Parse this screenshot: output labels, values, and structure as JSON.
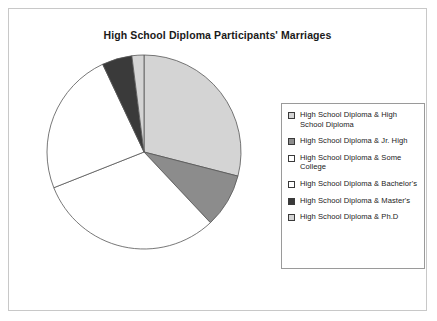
{
  "chart_title": "High School Diploma Participants' Marriages",
  "legend": {
    "items": [
      {
        "label": "High School Diploma & High School Diploma",
        "color": "#d4d4d4",
        "swatch_icon": "legend-swatch-icon"
      },
      {
        "label": "High School Diploma & Jr. High",
        "color": "#8c8c8c",
        "swatch_icon": "legend-swatch-icon"
      },
      {
        "label": "High School Diploma & Some College",
        "color": "#ffffff",
        "swatch_icon": "legend-swatch-icon"
      },
      {
        "label": "High School Diploma & Bachelor's",
        "color": "#ffffff",
        "swatch_icon": "legend-swatch-icon"
      },
      {
        "label": "High School Diploma & Master's",
        "color": "#3a3a3a",
        "swatch_icon": "legend-swatch-icon"
      },
      {
        "label": "High School Diploma & Ph.D",
        "color": "#d4d4d4",
        "swatch_icon": "legend-swatch-icon"
      }
    ]
  },
  "chart_data": {
    "type": "pie",
    "title": "High School Diploma Participants' Marriages",
    "xlabel": "",
    "ylabel": "",
    "legend_position": "right",
    "grid": false,
    "labels": [
      "High School Diploma & High School Diploma",
      "High School Diploma & Jr. High",
      "High School Diploma & Some College",
      "High School Diploma & Bachelor's",
      "High School Diploma & Master's",
      "High School Diploma & Ph.D"
    ],
    "values": [
      29,
      9,
      31,
      24,
      5,
      2
    ],
    "units": "percent",
    "colors": [
      "#d4d4d4",
      "#8c8c8c",
      "#ffffff",
      "#ffffff",
      "#3a3a3a",
      "#d4d4d4"
    ],
    "start_angle_deg": 0,
    "direction": "clockwise",
    "center": [
      125,
      107
    ],
    "radius": 97
  }
}
